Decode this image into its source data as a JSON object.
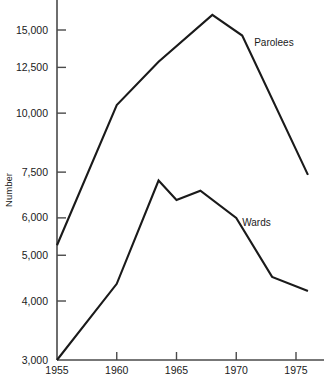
{
  "chart_data": {
    "type": "line",
    "title": "",
    "xlabel": "",
    "ylabel": "Number",
    "yscale": "log",
    "ylim": [
      3000,
      17000
    ],
    "xlim": [
      1955,
      1976.5
    ],
    "grid": false,
    "legend_position": "inline-annotation",
    "x_ticks": [
      1955,
      1960,
      1965,
      1970,
      1975
    ],
    "x_tick_labels": [
      "1955",
      "1960",
      "1965",
      "1970",
      "1975"
    ],
    "y_ticks": [
      3000,
      4000,
      5000,
      6000,
      7500,
      10000,
      12500,
      15000
    ],
    "y_tick_labels": [
      "3,000",
      "4,000",
      "5,000",
      "6,000",
      "7,500",
      "10,000",
      "12,500",
      "15,000"
    ],
    "series": [
      {
        "name": "Parolees",
        "label_x": 1971.5,
        "label_y": 13900,
        "x": [
          1955,
          1960,
          1963.5,
          1968,
          1970.5,
          1976
        ],
        "values": [
          5250,
          10400,
          12850,
          16150,
          14600,
          7400
        ]
      },
      {
        "name": "Wards",
        "label_x": 1970.5,
        "label_y": 5780,
        "x": [
          1955,
          1960,
          1963.5,
          1965,
          1967,
          1970,
          1973,
          1976
        ],
        "values": [
          3000,
          4350,
          7200,
          6550,
          6850,
          6000,
          4500,
          4200
        ]
      }
    ]
  },
  "axis": {
    "y_title": "Number"
  }
}
